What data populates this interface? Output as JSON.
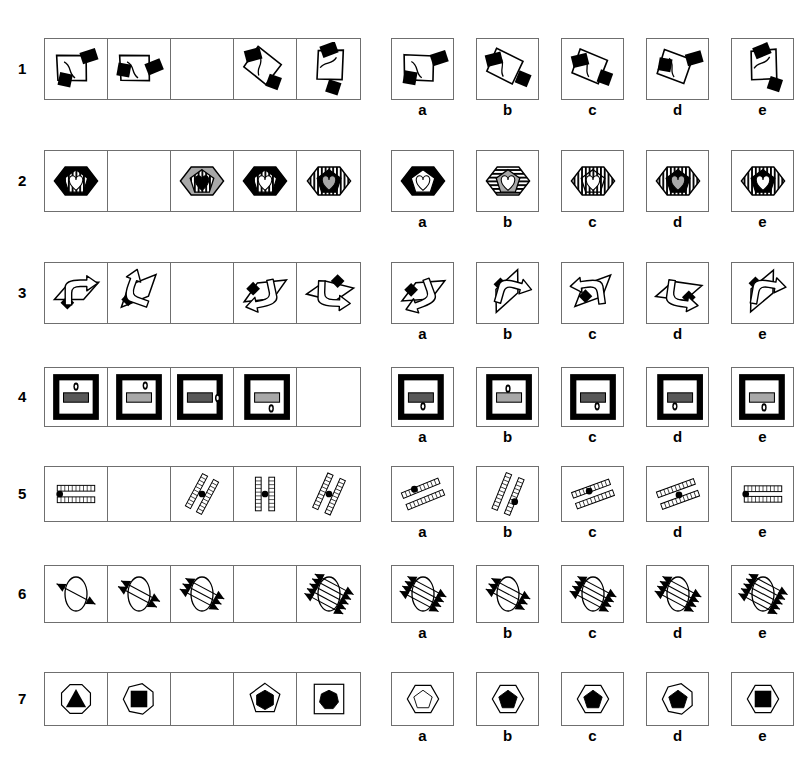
{
  "page": {
    "kind": "non-verbal-reasoning-test",
    "width": 751,
    "height": 760,
    "background": "#ffffff",
    "ink": "#000000",
    "box_border": "#6f6f6f",
    "grey_fill": "#a8a8a8",
    "dark_grey_fill": "#585858"
  },
  "option_labels": [
    "a",
    "b",
    "c",
    "d",
    "e"
  ],
  "rows": [
    {
      "number": "1",
      "top": 38,
      "cell_height": 62,
      "question_blank_index": 2,
      "cells": [
        {
          "figure": "quad-with-two-black-blocks-1"
        },
        {
          "figure": "quad-with-two-black-blocks-2"
        },
        {
          "figure": "blank"
        },
        {
          "figure": "quad-with-two-black-blocks-4"
        },
        {
          "figure": "quad-with-two-black-blocks-5"
        }
      ],
      "options": [
        {
          "label": "a",
          "figure": "opt-quad-a"
        },
        {
          "label": "b",
          "figure": "opt-quad-b"
        },
        {
          "label": "c",
          "figure": "opt-quad-c"
        },
        {
          "label": "d",
          "figure": "opt-quad-d"
        },
        {
          "label": "e",
          "figure": "opt-quad-e"
        }
      ]
    },
    {
      "number": "2",
      "top": 150,
      "cell_height": 62,
      "question_blank_index": 1,
      "cells": [
        {
          "figure": "hex-black-heart-striped"
        },
        {
          "figure": "blank"
        },
        {
          "figure": "hex-grey-pent-striped-black-heart"
        },
        {
          "figure": "hex-black-pent-grey-heart-striped"
        },
        {
          "figure": "hex-striped-black-pent-grey-heart"
        }
      ],
      "options": [
        {
          "label": "a",
          "figure": "opt-hex-a"
        },
        {
          "label": "b",
          "figure": "opt-hex-b"
        },
        {
          "label": "c",
          "figure": "opt-hex-c"
        },
        {
          "label": "d",
          "figure": "opt-hex-d"
        },
        {
          "label": "e",
          "figure": "opt-hex-e"
        }
      ]
    },
    {
      "number": "3",
      "top": 262,
      "cell_height": 62,
      "question_blank_index": 2,
      "cells": [
        {
          "figure": "parallelogram-arrow-1"
        },
        {
          "figure": "parallelogram-arrow-2"
        },
        {
          "figure": "blank"
        },
        {
          "figure": "parallelogram-arrow-4"
        },
        {
          "figure": "parallelogram-arrow-5"
        }
      ],
      "options": [
        {
          "label": "a",
          "figure": "opt-para-a"
        },
        {
          "label": "b",
          "figure": "opt-para-b"
        },
        {
          "label": "c",
          "figure": "opt-para-c"
        },
        {
          "label": "d",
          "figure": "opt-para-d"
        },
        {
          "label": "e",
          "figure": "opt-para-e"
        }
      ]
    },
    {
      "number": "4",
      "top": 367,
      "cell_height": 60,
      "question_blank_index": 4,
      "cells": [
        {
          "figure": "frame-dark-bar-top-dot"
        },
        {
          "figure": "frame-grey-bar-top-dot"
        },
        {
          "figure": "frame-dark-bar-right-dot"
        },
        {
          "figure": "frame-grey-bar-bottom-dot"
        },
        {
          "figure": "blank"
        }
      ],
      "options": [
        {
          "label": "a",
          "figure": "opt-frame-a"
        },
        {
          "label": "b",
          "figure": "opt-frame-b"
        },
        {
          "label": "c",
          "figure": "opt-frame-c"
        },
        {
          "label": "d",
          "figure": "opt-frame-d"
        },
        {
          "label": "e",
          "figure": "opt-frame-e"
        }
      ]
    },
    {
      "number": "5",
      "top": 466,
      "cell_height": 56,
      "question_blank_index": 1,
      "cells": [
        {
          "figure": "ladders-horizontal-dot-left"
        },
        {
          "figure": "blank"
        },
        {
          "figure": "ladders-diag-dot-center"
        },
        {
          "figure": "ladders-vertical-dot-center"
        },
        {
          "figure": "ladders-steep-dot-center"
        }
      ],
      "options": [
        {
          "label": "a",
          "figure": "opt-ladder-a"
        },
        {
          "label": "b",
          "figure": "opt-ladder-b"
        },
        {
          "label": "c",
          "figure": "opt-ladder-c"
        },
        {
          "label": "d",
          "figure": "opt-ladder-d"
        },
        {
          "label": "e",
          "figure": "opt-ladder-e"
        }
      ]
    },
    {
      "number": "6",
      "top": 565,
      "cell_height": 58,
      "question_blank_index": 3,
      "cells": [
        {
          "figure": "ellipse-arrows-1"
        },
        {
          "figure": "ellipse-arrows-2"
        },
        {
          "figure": "ellipse-arrows-3"
        },
        {
          "figure": "blank"
        },
        {
          "figure": "ellipse-arrows-5"
        }
      ],
      "options": [
        {
          "label": "a",
          "figure": "opt-ellipse-a"
        },
        {
          "label": "b",
          "figure": "opt-ellipse-b"
        },
        {
          "label": "c",
          "figure": "opt-ellipse-c"
        },
        {
          "label": "d",
          "figure": "opt-ellipse-d"
        },
        {
          "label": "e",
          "figure": "opt-ellipse-e"
        }
      ]
    },
    {
      "number": "7",
      "top": 672,
      "cell_height": 54,
      "question_blank_index": 2,
      "cells": [
        {
          "figure": "octagon-black-triangle"
        },
        {
          "figure": "heptagon-black-square"
        },
        {
          "figure": "blank"
        },
        {
          "figure": "pentagon-black-hexagon"
        },
        {
          "figure": "square-black-heptagon"
        }
      ],
      "options": [
        {
          "label": "a",
          "figure": "opt-poly-a"
        },
        {
          "label": "b",
          "figure": "opt-poly-b"
        },
        {
          "label": "c",
          "figure": "opt-poly-c"
        },
        {
          "label": "d",
          "figure": "opt-poly-d"
        },
        {
          "label": "e",
          "figure": "opt-poly-e"
        }
      ]
    }
  ]
}
